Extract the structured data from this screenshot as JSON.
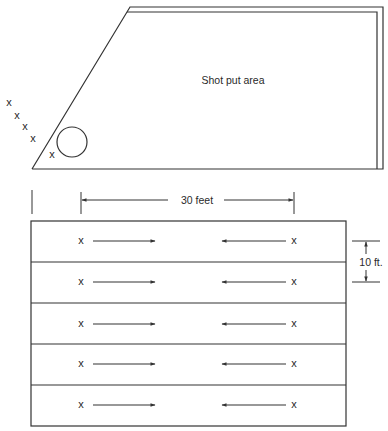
{
  "top_figure": {
    "area_label": "Shot put area",
    "throw_marks": [
      "x",
      "x",
      "x",
      "x",
      "x"
    ]
  },
  "bottom_figure": {
    "width_dimension_label": "30 feet",
    "lane_height_label": "10 ft.",
    "lanes": [
      {
        "left_marker": "x",
        "right_marker": "x",
        "left_arrow": "right",
        "right_arrow": "left"
      },
      {
        "left_marker": "x",
        "right_marker": "x",
        "left_arrow": "right",
        "right_arrow": "left"
      },
      {
        "left_marker": "x",
        "right_marker": "x",
        "left_arrow": "right",
        "right_arrow": "left"
      },
      {
        "left_marker": "x",
        "right_marker": "x",
        "left_arrow": "right",
        "right_arrow": "left"
      },
      {
        "left_marker": "x",
        "right_marker": "x",
        "left_arrow": "right",
        "right_arrow": "left"
      }
    ]
  },
  "colors": {
    "line": "#333333",
    "background": "#ffffff"
  }
}
